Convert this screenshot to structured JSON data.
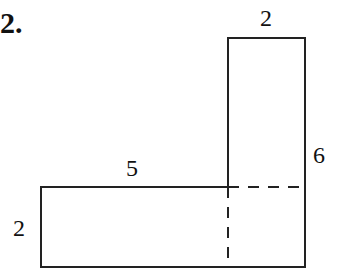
{
  "problem": {
    "number": "2."
  },
  "figure": {
    "shape": "L-shaped composite rectangle",
    "stroke_color": "#222222",
    "labels": {
      "top_width": "2",
      "right_height": "6",
      "middle_length": "5",
      "left_height": "2"
    },
    "vertical_rectangle": {
      "width": 2,
      "height": 6
    },
    "horizontal_rectangle": {
      "length": 5,
      "height": 2
    },
    "dashed_lines": [
      "horizontal divider inside vertical rectangle",
      "vertical divider at join"
    ]
  }
}
